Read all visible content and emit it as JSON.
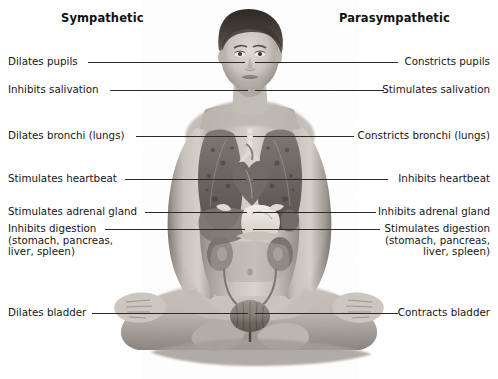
{
  "diagram": {
    "title_sympathetic": "Sympathetic",
    "title_parasympathetic": "Parasympathetic",
    "figure_alt": "grayscale photograph of a woman seated cross-legged with internal organs overlaid on her torso",
    "background_color": "#ffffff",
    "text_color": "#161616",
    "leader_line_color": "#2a2a2a"
  },
  "sympathetic": {
    "items": [
      {
        "label": "Dilates pupils",
        "line_y": 62,
        "text_x": 8,
        "text_y": 56,
        "line_x1": 88,
        "line_x2": 245
      },
      {
        "label": "Inhibits salivation",
        "line_y": 90,
        "text_x": 8,
        "text_y": 84,
        "line_x1": 110,
        "line_x2": 248
      },
      {
        "label": "Dilates bronchi (lungs)",
        "line_y": 136,
        "text_x": 8,
        "text_y": 130,
        "line_x1": 136,
        "line_x2": 247
      },
      {
        "label": "Stimulates heartbeat",
        "line_y": 179,
        "text_x": 8,
        "text_y": 173,
        "line_x1": 125,
        "line_x2": 246
      },
      {
        "label": "Stimulates adrenal gland",
        "line_y": 212,
        "text_x": 8,
        "text_y": 206,
        "line_x1": 145,
        "line_x2": 247
      },
      {
        "label": "Inhibits digestion\n(stomach, pancreas,\nliver, spleen)",
        "line_y": 229,
        "text_x": 8,
        "text_y": 223,
        "line_x1": 105,
        "line_x2": 245
      },
      {
        "label": "Dilates bladder",
        "line_y": 313,
        "text_x": 8,
        "text_y": 307,
        "line_x1": 92,
        "line_x2": 248
      }
    ]
  },
  "parasympathetic": {
    "items": [
      {
        "label": "Constricts pupils",
        "line_y": 62,
        "text_right": 490,
        "text_y": 56,
        "line_x1": 255,
        "line_x2": 398
      },
      {
        "label": "Stimulates salivation",
        "line_y": 90,
        "text_right": 490,
        "text_y": 84,
        "line_x1": 255,
        "line_x2": 384
      },
      {
        "label": "Constricts bronchi (lungs)",
        "line_y": 136,
        "text_right": 490,
        "text_y": 130,
        "line_x1": 253,
        "line_x2": 354
      },
      {
        "label": "Inhibits heartbeat",
        "line_y": 179,
        "text_right": 490,
        "text_y": 173,
        "line_x1": 253,
        "line_x2": 388
      },
      {
        "label": "Inhibits adrenal gland",
        "line_y": 212,
        "text_right": 490,
        "text_y": 206,
        "line_x1": 253,
        "line_x2": 376
      },
      {
        "label": "Stimulates digestion\n(stomach, pancreas,\nliver, spleen)",
        "line_y": 229,
        "text_right": 490,
        "text_y": 223,
        "line_x1": 253,
        "line_x2": 380
      },
      {
        "label": "Contracts bladder",
        "line_y": 313,
        "text_right": 490,
        "text_y": 307,
        "line_x1": 255,
        "line_x2": 398
      }
    ]
  },
  "organs": {
    "labels": [
      "lungs",
      "heart",
      "stomach",
      "liver",
      "spleen",
      "pancreas",
      "adrenal-gland",
      "kidneys",
      "ureters",
      "bladder"
    ]
  }
}
